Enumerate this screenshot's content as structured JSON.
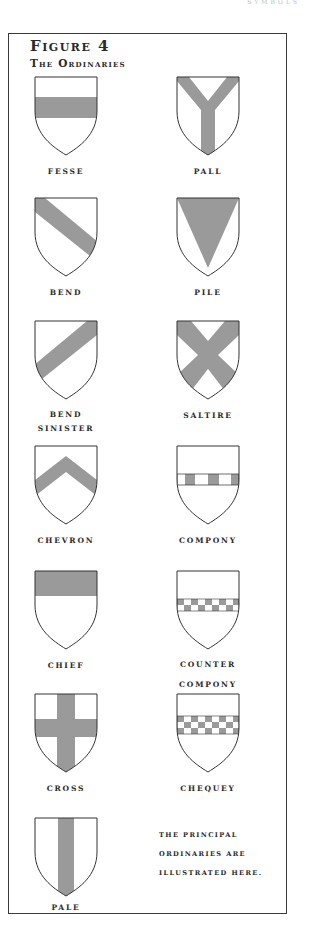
{
  "running_head": "SYMBOLS",
  "figure": {
    "title": "Figure 4",
    "subtitle": "The Ordinaries",
    "tincture_color": "#9a9a9a",
    "outline_color": "#333333"
  },
  "ordinaries": [
    {
      "id": "fesse",
      "label": "FESSE"
    },
    {
      "id": "pall",
      "label": "PALL"
    },
    {
      "id": "bend",
      "label": "BEND"
    },
    {
      "id": "pile",
      "label": "PILE"
    },
    {
      "id": "bend-sinister",
      "label": "BEND",
      "label2": "SINISTER"
    },
    {
      "id": "saltire",
      "label": "SALTIRE"
    },
    {
      "id": "chevron",
      "label": "CHEVRON"
    },
    {
      "id": "compony",
      "label": "COMPONY"
    },
    {
      "id": "chief",
      "label": "CHIEF"
    },
    {
      "id": "counter-compony",
      "label": "COUNTER",
      "label2": "COMPONY"
    },
    {
      "id": "cross",
      "label": "CROSS"
    },
    {
      "id": "chequey",
      "label": "CHEQUEY"
    },
    {
      "id": "pale",
      "label": "PALE"
    }
  ],
  "note": {
    "line1": "THE PRINCIPAL",
    "line2": "ORDINARIES ARE",
    "line3": "ILLUSTRATED HERE."
  }
}
